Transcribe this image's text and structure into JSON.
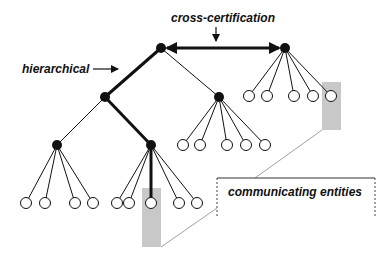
{
  "labels": {
    "cross_certification": "cross-certification",
    "hierarchical": "hierarchical",
    "communicating_entities": "communicating entities"
  },
  "colors": {
    "line": "#111111",
    "node_fill": "#111111",
    "leaf_fill": "#ffffff",
    "highlight": "#c8c8c8",
    "connector": "#888888"
  },
  "nodes": {
    "root": [
      161,
      48
    ],
    "peer": [
      285,
      48
    ],
    "left": [
      105,
      97
    ],
    "middle": [
      219,
      97
    ],
    "left_left": [
      57,
      145
    ],
    "left_right": [
      151,
      145
    ]
  },
  "leaves": {
    "peer": [
      [
        249,
        96
      ],
      [
        267,
        96
      ],
      [
        294,
        96
      ],
      [
        313,
        96
      ],
      [
        331,
        96
      ]
    ],
    "middle": [
      [
        183,
        145
      ],
      [
        200,
        145
      ],
      [
        227,
        145
      ],
      [
        246,
        145
      ],
      [
        265,
        145
      ]
    ],
    "left_left": [
      [
        26,
        203
      ],
      [
        45,
        203
      ],
      [
        75,
        203
      ],
      [
        93,
        203
      ]
    ],
    "left_right": [
      [
        117,
        203
      ],
      [
        129,
        203
      ],
      [
        151,
        203
      ],
      [
        179,
        203
      ],
      [
        197,
        203
      ]
    ]
  }
}
